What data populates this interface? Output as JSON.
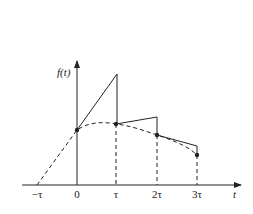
{
  "diagram": {
    "title": "",
    "y_axis_label": "f(t)",
    "x_axis_label": "t",
    "x_ticks": [
      "−τ",
      "0",
      "τ",
      "2τ",
      "3τ"
    ],
    "sample_points": [
      {
        "label": "0",
        "desc": "sample at t=0"
      },
      {
        "label": "τ",
        "desc": "sample at t=τ"
      },
      {
        "label": "2τ",
        "desc": "sample at t=2τ"
      },
      {
        "label": "3τ",
        "desc": "sample at t=3τ"
      }
    ],
    "curves": {
      "dashed": "continuous signal f(t)",
      "solid": "first-order hold reconstruction (sawtooth segments)"
    },
    "colors": {
      "line": "#222222",
      "background": "#ffffff"
    }
  }
}
